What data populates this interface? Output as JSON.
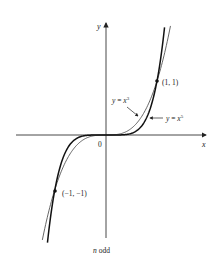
{
  "chart_data": {
    "type": "line",
    "title": "",
    "caption": "n odd",
    "xlabel": "x",
    "ylabel": "y",
    "origin_label": "0",
    "xlim": [
      -2.1,
      1.98
    ],
    "ylim": [
      -1.9,
      2.08
    ],
    "grid": false,
    "legend_position": "annotations",
    "series": [
      {
        "name": "y = x^3",
        "label_base": "y = x",
        "label_exp": "3",
        "function": "x^3",
        "stroke": "#555555",
        "weight": "thin"
      },
      {
        "name": "y = x^5",
        "label_base": "y = x",
        "label_exp": "5",
        "function": "x^5",
        "stroke": "#111111",
        "weight": "thick"
      }
    ],
    "points": [
      {
        "x": 1,
        "y": 1,
        "label": "(1, 1)"
      },
      {
        "x": -1,
        "y": -1,
        "label": "(−1, −1)"
      }
    ]
  }
}
